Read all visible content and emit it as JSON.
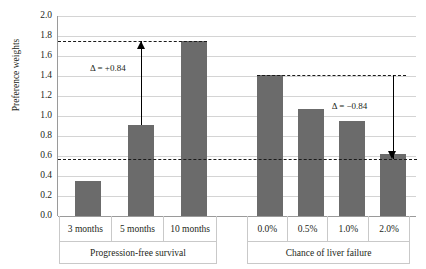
{
  "chart_data": {
    "type": "bar",
    "title": "",
    "xlabel": "",
    "ylabel": "Preference weights",
    "ylim": [
      0.0,
      2.0
    ],
    "ytick_labels": [
      "0.0",
      "0.2",
      "0.4",
      "0.6",
      "0.8",
      "1.0",
      "1.2",
      "1.4",
      "1.6",
      "1.8",
      "2.0"
    ],
    "ytick_values": [
      0.0,
      0.2,
      0.4,
      0.6,
      0.8,
      1.0,
      1.2,
      1.4,
      1.6,
      1.8,
      2.0
    ],
    "grid": true,
    "legend": "none",
    "groups": [
      {
        "name": "Progression-free survival",
        "categories": [
          "3 months",
          "5 months",
          "10 months"
        ],
        "values": [
          0.35,
          0.91,
          1.75
        ]
      },
      {
        "name": "Chance of liver failure",
        "categories": [
          "0.0%",
          "0.5%",
          "1.0%",
          "2.0%"
        ],
        "values": [
          1.41,
          1.07,
          0.95,
          0.62
        ]
      }
    ],
    "reference_lines": [
      {
        "name": "upper-left-reference",
        "value": 1.75
      },
      {
        "name": "lower-full-width-reference",
        "value": 0.57
      },
      {
        "name": "upper-right-reference",
        "value": 1.41
      }
    ],
    "annotations": [
      {
        "name": "delta-increase",
        "text": "Δ = +0.84",
        "from": 0.91,
        "to": 1.75,
        "direction": "up"
      },
      {
        "name": "delta-decrease",
        "text": "Δ = −0.84",
        "from": 1.41,
        "to": 0.57,
        "direction": "down"
      }
    ],
    "colors": {
      "bar": "#6b6b6b",
      "gridline": "#d4d4d4",
      "axis": "#9a9a9a",
      "annotation": "#1a1a1a",
      "background": "#ffffff"
    }
  }
}
